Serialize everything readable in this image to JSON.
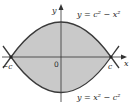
{
  "figure": {
    "type": "region-between-curves",
    "colors": {
      "shade": "#c9c9c9",
      "curve": "#3a3a3a",
      "axis": "#333333",
      "background": "#ffffff"
    },
    "axes": {
      "x_label": "x",
      "y_label": "y",
      "origin_label": "0",
      "left_intercept_label": "−c",
      "right_intercept_label": "c"
    },
    "curves": [
      {
        "name": "upper",
        "equation": "y = c² − x²"
      },
      {
        "name": "lower",
        "equation": "y = x² − c²"
      }
    ]
  }
}
